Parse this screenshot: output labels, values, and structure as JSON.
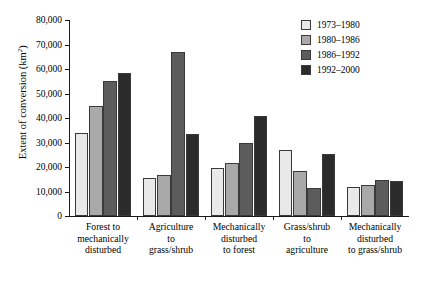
{
  "chart_data": {
    "type": "bar",
    "title": "",
    "xlabel": "",
    "ylabel": "Extent of conversion (km",
    "ylabel_sup": "2",
    "ylabel_suffix": ")",
    "ylim": [
      0,
      80000
    ],
    "ytick_step": 10000,
    "grid": false,
    "legend_position": "top-right",
    "ytick_labels": [
      "0",
      "10,000",
      "20,000",
      "30,000",
      "40,000",
      "50,000",
      "60,000",
      "70,000",
      "80,000"
    ],
    "ytick_values": [
      0,
      10000,
      20000,
      30000,
      40000,
      50000,
      60000,
      70000,
      80000
    ],
    "categories": [
      "Forest to\nmechanically\ndisturbed",
      "Agriculture\nto\ngrass/shrub",
      "Mechanically\ndisturbed\nto forest",
      "Grass/shrub\nto\nagriculture",
      "Mechanically\ndisturbed\nto grass/shrub"
    ],
    "category_lines": [
      [
        "Forest to",
        "mechanically",
        "disturbed"
      ],
      [
        "Agriculture",
        "to",
        "grass/shrub"
      ],
      [
        "Mechanically",
        "disturbed",
        "to forest"
      ],
      [
        "Grass/shrub",
        "to",
        "agriculture"
      ],
      [
        "Mechanically",
        "disturbed",
        "to grass/shrub"
      ]
    ],
    "series": [
      {
        "name": "1973–1980",
        "color": "#e9e9e9",
        "values": [
          34000,
          15500,
          19500,
          27000,
          12000
        ]
      },
      {
        "name": "1980–1986",
        "color": "#a9a9a9",
        "values": [
          45000,
          16800,
          21500,
          18500,
          12500
        ]
      },
      {
        "name": "1986–1992",
        "color": "#5c5c5c",
        "values": [
          55000,
          67000,
          30000,
          11500,
          14500
        ]
      },
      {
        "name": "1992–2000",
        "color": "#2b2b2b",
        "values": [
          58500,
          33500,
          41000,
          25500,
          14300
        ]
      }
    ]
  }
}
